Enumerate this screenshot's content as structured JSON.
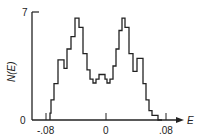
{
  "chart_data": {
    "type": "bar",
    "style": "step-histogram",
    "title": "",
    "xlabel": "E",
    "ylabel": "N(E)",
    "xlim": [
      -0.092,
      0.1
    ],
    "ylim": [
      0,
      7
    ],
    "x_ticks": [
      "-.08",
      "0",
      ".08"
    ],
    "x_tick_values": [
      -0.08,
      0,
      0.08
    ],
    "y_ticks": [
      "0",
      "7"
    ],
    "y_tick_values": [
      0,
      7
    ],
    "grid": false,
    "legend": null,
    "bin_edges": [
      -0.0747,
      -0.0733,
      -0.0693,
      -0.064,
      -0.06,
      -0.056,
      -0.052,
      -0.0467,
      -0.0413,
      -0.036,
      -0.0307,
      -0.0253,
      -0.0213,
      -0.0173,
      -0.0133,
      -0.0093,
      -0.0053,
      -0.0013,
      0.0013,
      0.0053,
      0.0093,
      0.0133,
      0.0173,
      0.0213,
      0.0253,
      0.0307,
      0.036,
      0.0413,
      0.0453,
      0.0493,
      0.0533,
      0.0573,
      0.0613,
      0.0653,
      0.0693,
      0.0747
    ],
    "values": [
      0.45,
      1.3,
      2.35,
      3.9,
      3.9,
      3.35,
      4.6,
      5.4,
      6.6,
      6.0,
      4.3,
      3.25,
      2.65,
      2.4,
      2.65,
      2.95,
      2.95,
      2.65,
      2.4,
      2.65,
      3.5,
      4.6,
      5.8,
      6.6,
      6.0,
      4.3,
      3.15,
      4.0,
      4.0,
      2.35,
      1.3,
      0.6,
      0.3,
      0.3,
      0.0
    ]
  },
  "axes": {
    "y_label": "N(E)",
    "y_top_tick": "7",
    "origin_label": "0",
    "x_label": "E",
    "x_tick_left": "-.08",
    "x_tick_mid": "0",
    "x_tick_right": ".08"
  }
}
